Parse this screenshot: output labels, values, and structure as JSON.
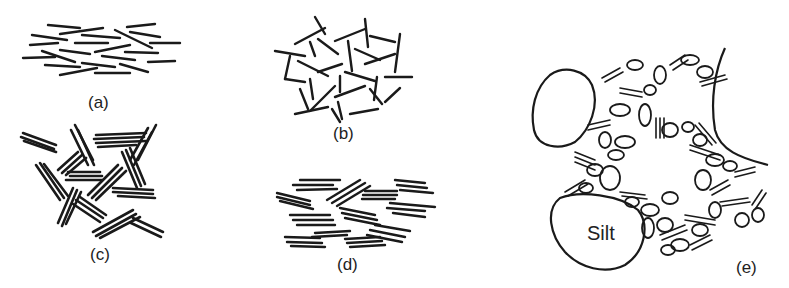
{
  "figure": {
    "panels": [
      {
        "id": "a",
        "label": "(a)",
        "arrangement": "parallel oriented single platelets"
      },
      {
        "id": "b",
        "label": "(b)",
        "arrangement": "random flocculated single platelets"
      },
      {
        "id": "c",
        "label": "(c)",
        "arrangement": "randomly oriented stacked packets"
      },
      {
        "id": "d",
        "label": "(d)",
        "arrangement": "oriented stacked packets"
      },
      {
        "id": "e",
        "label": "(e)",
        "arrangement": "mixed fabric with silt grains and clay aggregates",
        "silt_label": "Silt"
      }
    ]
  }
}
